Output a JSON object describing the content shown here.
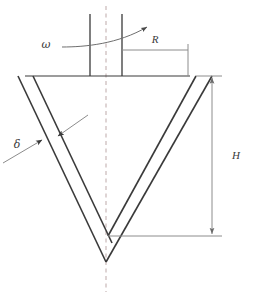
{
  "figure": {
    "background_color": "#ffffff",
    "line_color": "#3a3a3a",
    "thin_line_color": "#8c8c8c",
    "centerline_color": "#b9a6a6"
  },
  "labels": {
    "omega": "ω",
    "radius": "R",
    "height": "H",
    "thickness": "δ"
  },
  "annotations": {
    "omega_name": "angular-velocity",
    "radius_name": "radius-dimension",
    "height_name": "height-dimension",
    "thickness_name": "wall-thickness-dimension"
  },
  "geometry": {
    "centerline_x": 106,
    "shaft_left_x": 90,
    "shaft_right_x": 122,
    "shaft_top_y": 14,
    "plate_y": 76,
    "plate_left_x": 25,
    "plate_right_x": 190,
    "radius_line_y": 50,
    "radius_from_x": 122,
    "radius_to_x": 188,
    "height_line_x": 212,
    "height_top_y": 76,
    "height_bottom_y": 236,
    "inner_vertex_x": 108,
    "inner_vertex_y": 236,
    "outer_vertex_x": 106,
    "outer_vertex_y": 262,
    "centerline_bottom_y": 292
  }
}
